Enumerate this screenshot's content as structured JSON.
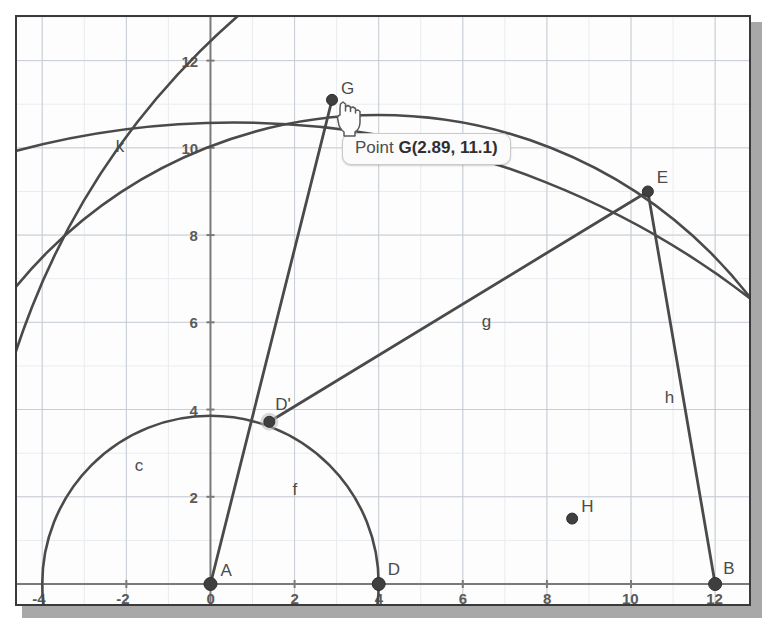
{
  "app": {
    "view_name": "Graphics View",
    "background_color": "#fdfdfd",
    "frame_color": "#3a3a3a",
    "shadow_color": "#a8a8a8",
    "object_color": "#4a4a4a",
    "grid_color": "#c8cdd4",
    "axis_color": "#7a7a7a"
  },
  "tooltip": {
    "prefix": "Point ",
    "value": "G(2.89, 11.1)",
    "full": "Point G(2.89, 11.1)"
  },
  "cursor": {
    "icon": "pointing-hand-cursor"
  },
  "axes": {
    "x_ticks": [
      "-4",
      "-2",
      "0",
      "2",
      "4",
      "6",
      "8",
      "10",
      "12"
    ],
    "x_tick_values": [
      -4,
      -2,
      0,
      2,
      4,
      6,
      8,
      10,
      12
    ],
    "y_ticks": [
      "2",
      "4",
      "6",
      "8",
      "10",
      "12"
    ],
    "y_tick_values": [
      2,
      4,
      6,
      8,
      10,
      12
    ],
    "x_range": [
      -4.6,
      12.9
    ],
    "y_range": [
      -0.55,
      13.0
    ]
  },
  "chart_data": {
    "type": "scatter",
    "title": "",
    "xlabel": "",
    "ylabel": "",
    "xlim": [
      -4.6,
      12.9
    ],
    "ylim": [
      -0.55,
      13.0
    ],
    "grid": true,
    "points": [
      {
        "name": "A",
        "label": "A",
        "x": 0,
        "y": 0,
        "label_dx": 10,
        "label_dy": -8
      },
      {
        "name": "D",
        "label": "D",
        "x": 4,
        "y": 0,
        "label_dx": 9,
        "label_dy": -9
      },
      {
        "name": "B",
        "label": "B",
        "x": 12,
        "y": 0,
        "label_dx": 8,
        "label_dy": -10
      },
      {
        "name": "E",
        "label": "E",
        "x": 10.4,
        "y": 9.0,
        "label_dx": 9,
        "label_dy": -8
      },
      {
        "name": "G",
        "label": "G",
        "x": 2.89,
        "y": 11.1,
        "label_dx": 9,
        "label_dy": -6
      },
      {
        "name": "H",
        "label": "H",
        "x": 8.6,
        "y": 1.5,
        "label_dx": 9,
        "label_dy": -7
      },
      {
        "name": "Dp",
        "label": "D'",
        "x": 1.4,
        "y": 3.72,
        "label_dx": 6,
        "label_dy": -12
      }
    ],
    "segments": [
      {
        "name": "f",
        "label": "f",
        "from": "A",
        "to": "G",
        "label_x": 1.95,
        "label_y": 2.05
      },
      {
        "name": "g",
        "label": "g",
        "from": "Dp",
        "to": "E",
        "label_x": 6.45,
        "label_y": 5.9
      },
      {
        "name": "h",
        "label": "h",
        "from": "E",
        "to": "B",
        "label_x": 10.8,
        "label_y": 4.15
      }
    ],
    "circles": [
      {
        "name": "c",
        "label": "c",
        "cx": 0,
        "cy": 0,
        "r": 4.0,
        "label_x": -1.8,
        "label_y": 2.6
      },
      {
        "name": "k",
        "label": "k",
        "cx": 0.55,
        "cy": -8.8,
        "r": 20.1,
        "label_x": -2.25,
        "label_y": 9.9
      },
      {
        "name": "arc_d",
        "label": "",
        "cx": 4,
        "cy": 0,
        "r": 11.15,
        "label_x": null,
        "label_y": null
      },
      {
        "name": "arc_b",
        "label": "",
        "cx": 12.4,
        "cy": 0,
        "r": 17.9,
        "label_x": null,
        "label_y": null
      }
    ]
  }
}
